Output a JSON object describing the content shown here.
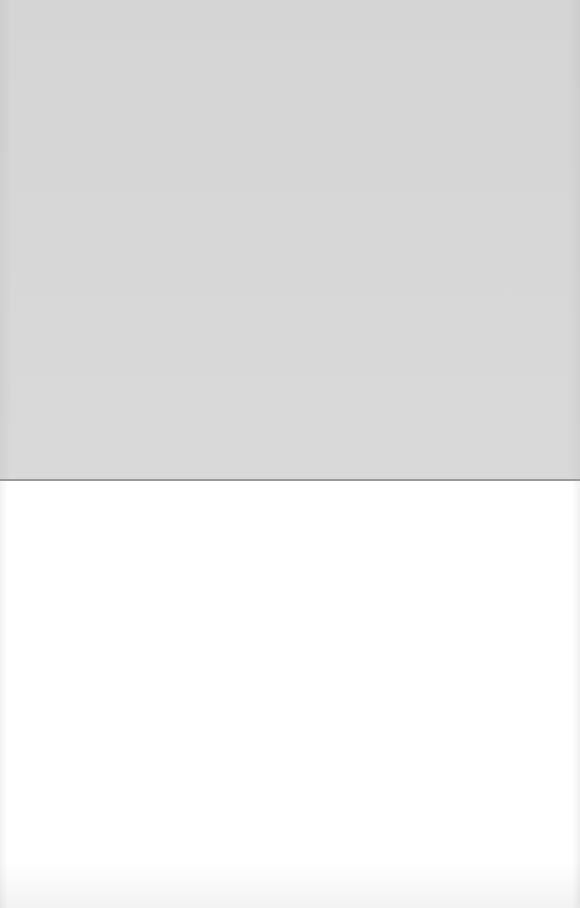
{
  "page": {
    "description": "",
    "upper_region": {
      "color": "#d9d9d9"
    },
    "fold_line": {
      "color": "#9a9a9a"
    },
    "lower_region": {
      "color": "#ffffff"
    }
  }
}
